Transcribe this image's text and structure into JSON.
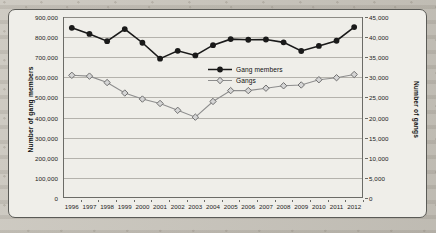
{
  "chart_data": {
    "type": "line",
    "title": "",
    "xlabel": "",
    "categories": [
      "1996",
      "1997",
      "1998",
      "1999",
      "2000",
      "2001",
      "2002",
      "2003",
      "2004",
      "2005",
      "2006",
      "2007",
      "2008",
      "2009",
      "2010",
      "2011",
      "2012"
    ],
    "series": [
      {
        "name": "Gang members",
        "axis": "left",
        "marker": "filled-circle",
        "color": "#1a1a1a",
        "values": [
          846000,
          816000,
          780000,
          840000,
          772000,
          693000,
          732000,
          709000,
          760000,
          790000,
          787000,
          788000,
          774000,
          731000,
          756000,
          782000,
          850000
        ]
      },
      {
        "name": "Gangs",
        "axis": "right",
        "marker": "open-diamond",
        "color": "#8e8e8e",
        "values": [
          30500,
          30300,
          28700,
          26100,
          24600,
          23500,
          21800,
          20100,
          24000,
          26700,
          26700,
          27300,
          27900,
          28100,
          29400,
          29900,
          30700
        ]
      }
    ],
    "axis_left": {
      "label": "Number of gang members",
      "ylim": [
        0,
        900000
      ],
      "ticks": [
        0,
        100000,
        200000,
        300000,
        400000,
        500000,
        600000,
        700000,
        800000,
        900000
      ],
      "ticklabels": [
        "0",
        "100,000",
        "200,000",
        "300,000",
        "400,000",
        "500,000",
        "600,000",
        "700,000",
        "800,000",
        "900,000"
      ]
    },
    "axis_right": {
      "label": "Number of gangs",
      "ylim": [
        0,
        45000
      ],
      "ticks": [
        0,
        5000,
        10000,
        15000,
        20000,
        25000,
        30000,
        35000,
        40000,
        45000
      ],
      "ticklabels": [
        "0",
        "5,000",
        "10,000",
        "15,000",
        "20,000",
        "25,000",
        "30,000",
        "35,000",
        "40,000",
        "45,000"
      ]
    },
    "legend": {
      "position": "inside-center",
      "entries": [
        "Gang members",
        "Gangs"
      ]
    },
    "grid": true
  }
}
